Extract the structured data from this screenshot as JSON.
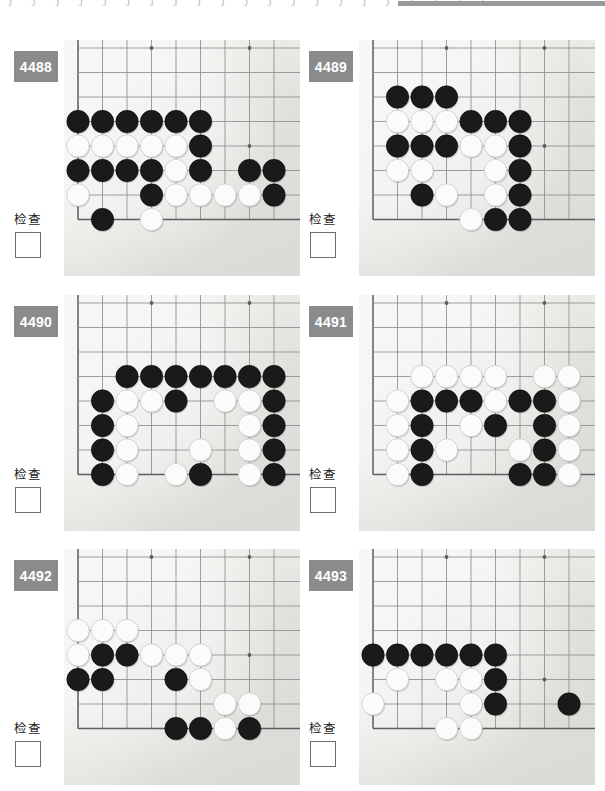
{
  "page": {
    "language": "zh-CN",
    "top_artifact_glyphs": [
      "J",
      "J",
      "J",
      "J",
      "J",
      "J",
      "J",
      "J",
      "J",
      "J",
      "J",
      "J",
      "J",
      "J",
      "J",
      "J",
      "J",
      "J",
      "J",
      "J",
      "J"
    ],
    "top_bar_color": "#9a9a9a"
  },
  "theme": {
    "badge_bg": "#8b8b8b",
    "badge_text": "#ffffff",
    "board_bg": "#eaeae6",
    "grid_line": "#8e8e90",
    "edge_line": "#5d5d60",
    "black_stone": "#1a1a1a",
    "white_stone": "#fbfbfb",
    "checkbox_border": "#6d6d6d",
    "page_bg": "#ffffff"
  },
  "board_spec": {
    "cols": 9,
    "rows": 9,
    "note": "each panel shows a lower-left corner fragment of a 19x19 goban",
    "cell_px": 24.5,
    "origin_x_px": 14,
    "origin_y_px": 8,
    "stone_radius_px": 11.2
  },
  "check_label": "检查",
  "panels": [
    {
      "id": "4488",
      "number": "4488",
      "check_label": "检查",
      "checkbox_checked": false,
      "board": {
        "left_edge_col": 1,
        "bottom_edge_row": 8,
        "star_points": [
          [
            4,
            1
          ],
          [
            8,
            1
          ],
          [
            4,
            5
          ],
          [
            8,
            5
          ]
        ],
        "black": [
          [
            1,
            4
          ],
          [
            2,
            4
          ],
          [
            3,
            4
          ],
          [
            4,
            4
          ],
          [
            5,
            4
          ],
          [
            6,
            4
          ],
          [
            6,
            5
          ],
          [
            1,
            6
          ],
          [
            2,
            6
          ],
          [
            3,
            6
          ],
          [
            4,
            6
          ],
          [
            6,
            6
          ],
          [
            8,
            6
          ],
          [
            9,
            6
          ],
          [
            4,
            7
          ],
          [
            9,
            7
          ],
          [
            2,
            8
          ]
        ],
        "white": [
          [
            1,
            5
          ],
          [
            2,
            5
          ],
          [
            3,
            5
          ],
          [
            4,
            5
          ],
          [
            5,
            5
          ],
          [
            5,
            6
          ],
          [
            1,
            7
          ],
          [
            5,
            7
          ],
          [
            6,
            7
          ],
          [
            7,
            7
          ],
          [
            8,
            7
          ],
          [
            4,
            8
          ]
        ]
      }
    },
    {
      "id": "4489",
      "number": "4489",
      "check_label": "检查",
      "checkbox_checked": false,
      "board": {
        "left_edge_col": 1,
        "bottom_edge_row": 8,
        "star_points": [
          [
            4,
            1
          ],
          [
            8,
            1
          ],
          [
            8,
            5
          ]
        ],
        "black": [
          [
            2,
            3
          ],
          [
            3,
            3
          ],
          [
            4,
            3
          ],
          [
            5,
            4
          ],
          [
            6,
            4
          ],
          [
            7,
            4
          ],
          [
            2,
            5
          ],
          [
            3,
            5
          ],
          [
            4,
            5
          ],
          [
            7,
            5
          ],
          [
            7,
            6
          ],
          [
            3,
            7
          ],
          [
            7,
            7
          ],
          [
            6,
            8
          ],
          [
            7,
            8
          ]
        ],
        "white": [
          [
            2,
            4
          ],
          [
            3,
            4
          ],
          [
            4,
            4
          ],
          [
            5,
            5
          ],
          [
            6,
            5
          ],
          [
            2,
            6
          ],
          [
            3,
            6
          ],
          [
            6,
            6
          ],
          [
            4,
            7
          ],
          [
            6,
            7
          ],
          [
            5,
            8
          ]
        ]
      }
    },
    {
      "id": "4490",
      "number": "4490",
      "check_label": "检查",
      "checkbox_checked": false,
      "board": {
        "left_edge_col": 1,
        "bottom_edge_row": 8,
        "star_points": [
          [
            4,
            1
          ],
          [
            8,
            1
          ]
        ],
        "black": [
          [
            3,
            4
          ],
          [
            4,
            4
          ],
          [
            5,
            4
          ],
          [
            6,
            4
          ],
          [
            7,
            4
          ],
          [
            8,
            4
          ],
          [
            9,
            4
          ],
          [
            2,
            5
          ],
          [
            5,
            5
          ],
          [
            9,
            5
          ],
          [
            2,
            6
          ],
          [
            9,
            6
          ],
          [
            2,
            7
          ],
          [
            9,
            7
          ],
          [
            2,
            8
          ],
          [
            6,
            8
          ],
          [
            9,
            8
          ]
        ],
        "white": [
          [
            3,
            5
          ],
          [
            4,
            5
          ],
          [
            7,
            5
          ],
          [
            8,
            5
          ],
          [
            3,
            6
          ],
          [
            8,
            6
          ],
          [
            3,
            7
          ],
          [
            6,
            7
          ],
          [
            8,
            7
          ],
          [
            3,
            8
          ],
          [
            5,
            8
          ],
          [
            8,
            8
          ]
        ]
      }
    },
    {
      "id": "4491",
      "number": "4491",
      "check_label": "检查",
      "checkbox_checked": false,
      "board": {
        "left_edge_col": 1,
        "bottom_edge_row": 8,
        "star_points": [
          [
            4,
            1
          ],
          [
            8,
            1
          ],
          [
            8,
            5
          ]
        ],
        "black": [
          [
            3,
            5
          ],
          [
            4,
            5
          ],
          [
            5,
            5
          ],
          [
            7,
            5
          ],
          [
            8,
            5
          ],
          [
            3,
            6
          ],
          [
            6,
            6
          ],
          [
            8,
            6
          ],
          [
            3,
            7
          ],
          [
            8,
            7
          ],
          [
            3,
            8
          ],
          [
            7,
            8
          ],
          [
            8,
            8
          ]
        ],
        "white": [
          [
            3,
            4
          ],
          [
            4,
            4
          ],
          [
            5,
            4
          ],
          [
            6,
            4
          ],
          [
            8,
            4
          ],
          [
            9,
            4
          ],
          [
            2,
            5
          ],
          [
            6,
            5
          ],
          [
            9,
            5
          ],
          [
            2,
            6
          ],
          [
            5,
            6
          ],
          [
            9,
            6
          ],
          [
            2,
            7
          ],
          [
            4,
            7
          ],
          [
            7,
            7
          ],
          [
            9,
            7
          ],
          [
            2,
            8
          ],
          [
            9,
            8
          ]
        ]
      }
    },
    {
      "id": "4492",
      "number": "4492",
      "check_label": "检查",
      "checkbox_checked": false,
      "board": {
        "left_edge_col": 1,
        "bottom_edge_row": 8,
        "star_points": [
          [
            4,
            1
          ],
          [
            8,
            1
          ],
          [
            8,
            5
          ]
        ],
        "black": [
          [
            2,
            5
          ],
          [
            3,
            5
          ],
          [
            1,
            6
          ],
          [
            2,
            6
          ],
          [
            5,
            6
          ],
          [
            5,
            8
          ],
          [
            6,
            8
          ],
          [
            8,
            8
          ]
        ],
        "white": [
          [
            1,
            4
          ],
          [
            2,
            4
          ],
          [
            3,
            4
          ],
          [
            1,
            5
          ],
          [
            4,
            5
          ],
          [
            5,
            5
          ],
          [
            6,
            5
          ],
          [
            6,
            6
          ],
          [
            7,
            7
          ],
          [
            8,
            7
          ],
          [
            7,
            8
          ]
        ]
      }
    },
    {
      "id": "4493",
      "number": "4493",
      "check_label": "检查",
      "checkbox_checked": false,
      "board": {
        "left_edge_col": 1,
        "bottom_edge_row": 8,
        "star_points": [
          [
            4,
            1
          ],
          [
            8,
            1
          ],
          [
            8,
            6
          ]
        ],
        "black": [
          [
            1,
            5
          ],
          [
            2,
            5
          ],
          [
            3,
            5
          ],
          [
            4,
            5
          ],
          [
            5,
            5
          ],
          [
            6,
            5
          ],
          [
            6,
            6
          ],
          [
            6,
            7
          ],
          [
            9,
            7
          ]
        ],
        "white": [
          [
            2,
            6
          ],
          [
            4,
            6
          ],
          [
            5,
            6
          ],
          [
            1,
            7
          ],
          [
            5,
            7
          ],
          [
            4,
            8
          ],
          [
            5,
            8
          ]
        ]
      }
    }
  ]
}
